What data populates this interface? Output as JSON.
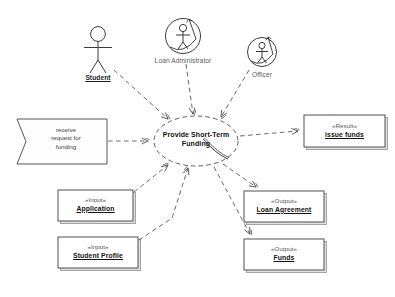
{
  "diagram": {
    "type": "uml-use-case",
    "background_color": "#ffffff",
    "line_color": "#555555",
    "box_fill": "#ffffff",
    "box_border": "#444444",
    "shadow_color": "#bbbbbb"
  },
  "use_case": {
    "name_line1": "Provide Short-Term",
    "name_line2": "Funding",
    "shape": "ellipse"
  },
  "actors": [
    {
      "id": "student",
      "label": "Student",
      "icon": "stick-figure-icon",
      "style": "plain",
      "label_bold": true,
      "label_underline": true
    },
    {
      "id": "loan-administrator",
      "label": "Loan Administrator",
      "icon": "circled-stick-figure-icon",
      "style": "circled",
      "label_bold": false,
      "label_underline": false
    },
    {
      "id": "officer",
      "label": "Officer",
      "icon": "circled-stick-figure-icon",
      "style": "circled",
      "label_bold": false,
      "label_underline": false
    }
  ],
  "trigger": {
    "id": "receive-request-for-funding",
    "shape": "flag",
    "line1": "receive",
    "line2": "request for",
    "line3": "funding"
  },
  "artifacts": [
    {
      "id": "application",
      "stereotype": "«Input»",
      "name": "Application",
      "side": "left"
    },
    {
      "id": "student-profile",
      "stereotype": "«Input»",
      "name": "Student Profile",
      "side": "left"
    },
    {
      "id": "loan-agreement",
      "stereotype": "«Output»",
      "name": "Loan Agreement",
      "side": "right"
    },
    {
      "id": "funds",
      "stereotype": "«Output»",
      "name": "Funds",
      "side": "right"
    },
    {
      "id": "issue-funds",
      "stereotype": "«Result»",
      "name": "issue funds",
      "side": "right"
    }
  ],
  "connectors": [
    {
      "id": "student-to-usecase",
      "from": "student",
      "to": "use-case",
      "style": "dashed",
      "arrow": "open"
    },
    {
      "id": "loan-administrator-to-usecase",
      "from": "loan-administrator",
      "to": "use-case",
      "style": "dashed",
      "arrow": "open"
    },
    {
      "id": "officer-to-usecase",
      "from": "officer",
      "to": "use-case",
      "style": "dashed",
      "arrow": "open"
    },
    {
      "id": "trigger-to-usecase",
      "from": "receive-request-for-funding",
      "to": "use-case",
      "style": "dashed",
      "arrow": "open"
    },
    {
      "id": "application-to-usecase",
      "from": "application",
      "to": "use-case",
      "style": "dashed",
      "arrow": "open"
    },
    {
      "id": "student-profile-to-usecase",
      "from": "student-profile",
      "to": "use-case",
      "style": "dashed",
      "arrow": "open"
    },
    {
      "id": "usecase-to-issue-funds",
      "from": "use-case",
      "to": "issue-funds",
      "style": "dashed",
      "arrow": "open"
    },
    {
      "id": "usecase-to-loan-agreement",
      "from": "use-case",
      "to": "loan-agreement",
      "style": "dashed",
      "arrow": "open"
    },
    {
      "id": "usecase-to-funds",
      "from": "use-case",
      "to": "funds",
      "style": "dashed",
      "arrow": "open"
    }
  ]
}
